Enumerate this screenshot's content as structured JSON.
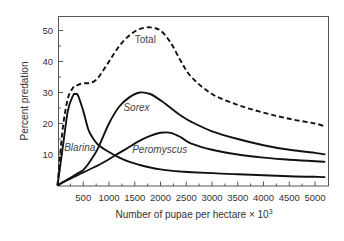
{
  "chart_data": {
    "type": "line",
    "title": "",
    "xlabel": "Number of pupae per hectare × 10",
    "xlabel_superscript": "3",
    "ylabel": "Percent predation",
    "xlim": [
      0,
      5200
    ],
    "ylim": [
      0,
      53
    ],
    "grid": false,
    "legend": "inline labels",
    "x_ticks": [
      500,
      1000,
      1500,
      2000,
      2500,
      3000,
      3500,
      4000,
      4500,
      5000
    ],
    "x_tick_labels": [
      "500",
      "1000",
      "1500",
      "2000",
      "2500",
      "3000",
      "3500",
      "4000",
      "4500",
      "5000"
    ],
    "y_ticks": [
      10,
      20,
      30,
      40,
      50
    ],
    "y_tick_labels": [
      "10",
      "20",
      "30",
      "40",
      "50"
    ],
    "x": [
      0,
      100,
      200,
      300,
      350,
      400,
      500,
      600,
      700,
      800,
      1000,
      1200,
      1400,
      1600,
      1800,
      2000,
      2200,
      2400,
      2600,
      3000,
      3500,
      4000,
      4500,
      5000,
      5200
    ],
    "series": [
      {
        "name": "Total",
        "style": "dashed",
        "values": [
          0,
          18,
          28,
          31.5,
          32,
          32.5,
          33,
          33,
          33.5,
          35,
          40,
          45,
          48.5,
          50.5,
          51,
          50,
          46,
          40,
          35,
          29.5,
          26,
          23.5,
          21.5,
          20,
          19
        ]
      },
      {
        "name": "Sorex",
        "style": "solid",
        "values": [
          0,
          1,
          2,
          3,
          3.5,
          4,
          5,
          7,
          9.5,
          12.5,
          20,
          25.5,
          28.5,
          30,
          29.5,
          27.5,
          25,
          22.5,
          20.5,
          17.5,
          15,
          13,
          11.5,
          10.5,
          10
        ]
      },
      {
        "name": "Peromyscus",
        "style": "solid",
        "values": [
          0,
          1,
          1.8,
          2.6,
          3,
          3.4,
          4.2,
          5,
          5.8,
          6.6,
          8.5,
          10.5,
          12.5,
          14.5,
          16,
          17,
          17,
          15.5,
          13.5,
          11.5,
          10,
          9,
          8.3,
          7.8,
          7.6
        ]
      },
      {
        "name": "Blarina",
        "style": "solid",
        "values": [
          0,
          12,
          24,
          29,
          29.5,
          29,
          24,
          18,
          15,
          13,
          10.8,
          9,
          7.6,
          6.6,
          5.8,
          5.2,
          4.8,
          4.5,
          4.3,
          4,
          3.6,
          3.3,
          3,
          2.8,
          2.7
        ]
      }
    ],
    "annotations": [
      {
        "text": "Total",
        "x": 1500,
        "y": 46
      },
      {
        "text": "Sorex",
        "x": 1280,
        "y": 24
      },
      {
        "text": "Blarina",
        "x": 130,
        "y": 11
      },
      {
        "text": "Peromyscus",
        "x": 1450,
        "y": 10.5
      }
    ]
  }
}
